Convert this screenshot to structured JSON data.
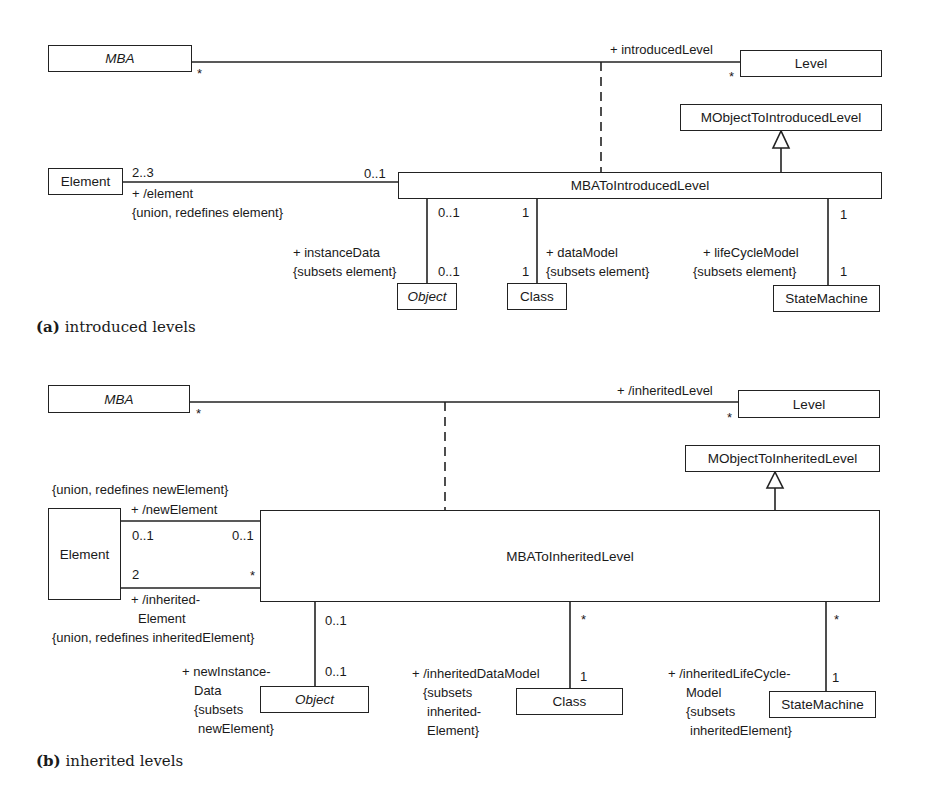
{
  "diagram_a": {
    "caption_tag": "(a)",
    "caption_text": "introduced levels",
    "classes": {
      "mba": "MBA",
      "level": "Level",
      "mobject_to_level": "MObjectToIntroducedLevel",
      "assoc_class": "MBAToIntroducedLevel",
      "element": "Element",
      "object": "Object",
      "class": "Class",
      "state_machine": "StateMachine"
    },
    "labels": {
      "mba_mult": "*",
      "level_role": "+ introducedLevel",
      "level_mult": "*",
      "element_mult": "2..3",
      "element_role": "+ /element",
      "element_constraint": "{union, redefines element}",
      "assoc_element_mult": "0..1",
      "object_top_mult": "0..1",
      "object_role": "+ instanceData",
      "object_constraint": "{subsets element}",
      "object_bottom_mult": "0..1",
      "class_top_mult": "1",
      "class_role": "+ dataModel",
      "class_constraint": "{subsets element}",
      "class_bottom_mult": "1",
      "sm_top_mult": "1",
      "sm_role": "+ lifeCycleModel",
      "sm_constraint": "{subsets element}",
      "sm_bottom_mult": "1"
    }
  },
  "diagram_b": {
    "caption_tag": "(b)",
    "caption_text": "inherited levels",
    "classes": {
      "mba": "MBA",
      "level": "Level",
      "mobject_to_level": "MObjectToInheritedLevel",
      "assoc_class": "MBAToInheritedLevel",
      "element": "Element",
      "object": "Object",
      "class": "Class",
      "state_machine": "StateMachine"
    },
    "labels": {
      "mba_mult": "*",
      "level_role": "+ /inheritedLevel",
      "level_mult": "*",
      "new_element_constraint": "{union, redefines newElement}",
      "new_element_role": "+ /newElement",
      "new_element_mult_left": "0..1",
      "new_element_mult_right": "0..1",
      "inh_element_mult_left": "2",
      "inh_element_mult_right": "*",
      "inh_element_role_1": "+ /inherited-",
      "inh_element_role_2": "Element",
      "inh_element_constraint": "{union, redefines inheritedElement}",
      "object_top_mult": "0..1",
      "object_role_1": "+ newInstance-",
      "object_role_2": "Data",
      "object_role_3": "{subsets",
      "object_role_4": "newElement}",
      "object_bottom_mult": "0..1",
      "class_top_mult": "*",
      "class_role_1": "+ /inheritedDataModel",
      "class_role_2": "{subsets",
      "class_role_3": "inherited-",
      "class_role_4": "Element}",
      "class_bottom_mult": "1",
      "sm_top_mult": "*",
      "sm_role_1": "+ /inheritedLifeCycle-",
      "sm_role_2": "Model",
      "sm_role_3": "{subsets",
      "sm_role_4": "inheritedElement}",
      "sm_bottom_mult": "1"
    }
  }
}
